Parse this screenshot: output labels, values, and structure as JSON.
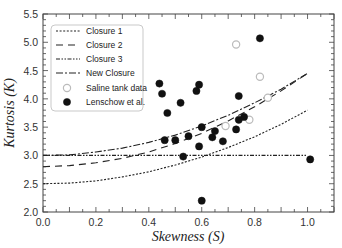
{
  "chart_data": {
    "type": "scatter",
    "title": "",
    "xlabel": "Skewness (S)",
    "ylabel": "Kurtosis (K)",
    "xlim": [
      0.0,
      1.1
    ],
    "ylim": [
      2.0,
      5.5
    ],
    "xticks": [
      0.0,
      0.2,
      0.4,
      0.6,
      0.8,
      1.0
    ],
    "yticks": [
      2.0,
      2.5,
      3.0,
      3.5,
      4.0,
      4.5,
      5.0,
      5.5
    ],
    "xtick_labels": [
      "0.0",
      "0.2",
      "0.4",
      "0.6",
      "0.8",
      "1.0"
    ],
    "ytick_labels": [
      "2.0",
      "2.5",
      "3.0",
      "3.5",
      "4.0",
      "4.5",
      "5.0",
      "5.5"
    ],
    "grid": false,
    "legend_position": "upper left",
    "series": [
      {
        "name": "Closure 1",
        "kind": "line",
        "style": "dotted",
        "color": "#222222",
        "x": [
          0.0,
          0.1,
          0.2,
          0.3,
          0.4,
          0.5,
          0.6,
          0.7,
          0.8,
          0.9,
          1.0
        ],
        "values": [
          2.5,
          2.51,
          2.55,
          2.62,
          2.71,
          2.83,
          2.97,
          3.14,
          3.33,
          3.55,
          3.8
        ]
      },
      {
        "name": "Closure 2",
        "kind": "line",
        "style": "dashed",
        "color": "#222222",
        "x": [
          0.0,
          0.1,
          0.2,
          0.3,
          0.4,
          0.5,
          0.6,
          0.7,
          0.8,
          0.9,
          1.0
        ],
        "values": [
          2.8,
          2.82,
          2.87,
          2.95,
          3.06,
          3.21,
          3.39,
          3.61,
          3.86,
          4.14,
          4.45
        ]
      },
      {
        "name": "Closure 3",
        "kind": "line",
        "style": "dash-dot-dot",
        "color": "#222222",
        "x": [
          0.0,
          1.0
        ],
        "values": [
          3.0,
          3.0
        ]
      },
      {
        "name": "New Closure",
        "kind": "line",
        "style": "dash-dot",
        "color": "#222222",
        "x": [
          0.0,
          0.1,
          0.2,
          0.3,
          0.4,
          0.5,
          0.6,
          0.7,
          0.8,
          0.9,
          1.0
        ],
        "values": [
          3.0,
          3.01,
          3.06,
          3.13,
          3.23,
          3.36,
          3.52,
          3.71,
          3.93,
          4.17,
          4.45
        ]
      },
      {
        "name": "Saline tank data",
        "kind": "scatter",
        "marker": "open-circle",
        "color": "#bbbbbb",
        "x": [
          0.73,
          0.82,
          0.85,
          0.69,
          0.78
        ],
        "values": [
          4.96,
          4.39,
          4.02,
          3.52,
          3.63
        ]
      },
      {
        "name": "Lenschow et al.",
        "kind": "scatter",
        "marker": "filled-circle",
        "color": "#111111",
        "x": [
          0.44,
          0.45,
          0.47,
          0.52,
          0.59,
          0.58,
          0.46,
          0.5,
          0.55,
          0.6,
          0.65,
          0.64,
          0.68,
          0.59,
          0.53,
          0.74,
          0.73,
          0.76,
          0.74,
          0.82,
          0.6,
          1.01
        ],
        "values": [
          4.27,
          4.09,
          3.75,
          3.93,
          4.25,
          4.14,
          3.27,
          3.27,
          3.34,
          3.5,
          3.43,
          3.32,
          3.25,
          3.16,
          2.98,
          3.63,
          3.46,
          3.68,
          4.05,
          5.07,
          2.2,
          2.93
        ]
      }
    ]
  },
  "legend": {
    "items": [
      {
        "label": "Closure 1"
      },
      {
        "label": "Closure 2"
      },
      {
        "label": "Closure 3"
      },
      {
        "label": "New Closure"
      },
      {
        "label": "Saline tank data"
      },
      {
        "label": "Lenschow et al."
      }
    ]
  }
}
